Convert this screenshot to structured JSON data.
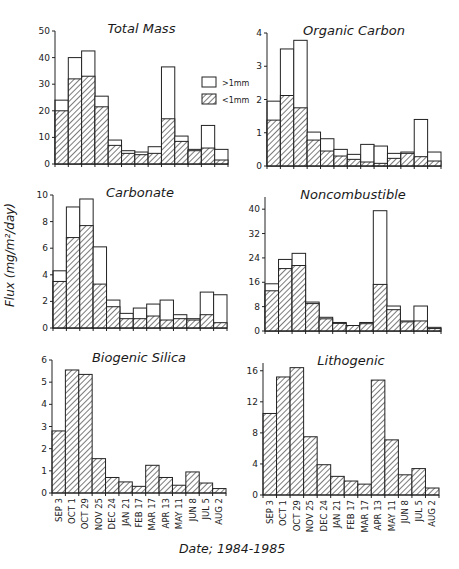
{
  "figure": {
    "ylabel": "Flux (mg/m²/day)",
    "xlabel": "Date; 1984-1985",
    "legend": [
      {
        "key": "coarse",
        "label": ">1mm",
        "style": "open"
      },
      {
        "key": "fine",
        "label": "<1mm",
        "style": "hatched"
      }
    ]
  },
  "chart_data": [
    {
      "type": "bar",
      "stacked": true,
      "title": "Total Mass",
      "xlabel": "Date; 1984-1985",
      "ylabel": "Flux (mg/m²/day)",
      "categories": [
        "SEP 3",
        "OCT 1",
        "OCT 29",
        "NOV 25",
        "DEC 24",
        "JAN 21",
        "FEB 17",
        "MAR 17",
        "APR 13",
        "MAY 11",
        "JUN 8",
        "JUL 5",
        "AUG 2"
      ],
      "ylim": [
        0,
        50
      ],
      "yticks": [
        0,
        10,
        20,
        30,
        40,
        50
      ],
      "legend": {
        "position": "right",
        "entries": [
          ">1mm",
          "<1mm"
        ]
      },
      "series": [
        {
          "name": "<1mm",
          "values": [
            20,
            32,
            33,
            21.5,
            7,
            4,
            3.5,
            4,
            17,
            8.5,
            5,
            6,
            1.5
          ]
        },
        {
          "name": "total (>1mm + <1mm)",
          "values": [
            24,
            40,
            42.5,
            25.5,
            9,
            5,
            4.5,
            6.5,
            36.5,
            10.5,
            5.5,
            14.5,
            5.5
          ]
        }
      ]
    },
    {
      "type": "bar",
      "stacked": true,
      "title": "Organic Carbon",
      "categories": [
        "SEP 3",
        "OCT 1",
        "OCT 29",
        "NOV 25",
        "DEC 24",
        "JAN 21",
        "FEB 17",
        "MAR 17",
        "APR 13",
        "MAY 11",
        "JUN 8",
        "JUL 5",
        "AUG 2"
      ],
      "ylim": [
        0,
        4
      ],
      "yticks": [
        0,
        1,
        2,
        3,
        4
      ],
      "series": [
        {
          "name": "<1mm",
          "values": [
            1.38,
            2.12,
            1.75,
            0.78,
            0.45,
            0.3,
            0.2,
            0.12,
            0.08,
            0.23,
            0.38,
            0.28,
            0.15
          ]
        },
        {
          "name": "total (>1mm + <1mm)",
          "values": [
            1.95,
            3.52,
            3.78,
            1.02,
            0.82,
            0.5,
            0.35,
            0.65,
            0.6,
            0.38,
            0.42,
            1.4,
            0.42
          ]
        }
      ]
    },
    {
      "type": "bar",
      "stacked": true,
      "title": "Carbonate",
      "categories": [
        "SEP 3",
        "OCT 1",
        "OCT 29",
        "NOV 25",
        "DEC 24",
        "JAN 21",
        "FEB 17",
        "MAR 17",
        "APR 13",
        "MAY 11",
        "JUN 8",
        "JUL 5",
        "AUG 2"
      ],
      "ylim": [
        0,
        10
      ],
      "yticks": [
        0,
        2,
        4,
        6,
        8,
        10
      ],
      "series": [
        {
          "name": "<1mm",
          "values": [
            3.5,
            6.8,
            7.7,
            3.3,
            1.6,
            0.7,
            0.7,
            0.9,
            0.6,
            0.7,
            0.6,
            1.0,
            0.4
          ]
        },
        {
          "name": "total (>1mm + <1mm)",
          "values": [
            4.3,
            9.1,
            9.7,
            6.1,
            2.1,
            1.1,
            1.5,
            1.8,
            2.1,
            1.0,
            0.7,
            2.7,
            2.5
          ]
        }
      ]
    },
    {
      "type": "bar",
      "stacked": true,
      "title": "Noncombustible",
      "categories": [
        "SEP 3",
        "OCT 1",
        "OCT 29",
        "NOV 25",
        "DEC 24",
        "JAN 21",
        "FEB 17",
        "MAR 17",
        "APR 13",
        "MAY 11",
        "JUN 8",
        "JUL 5",
        "AUG 2"
      ],
      "ylim": [
        0,
        44
      ],
      "yticks": [
        0,
        8,
        16,
        24,
        32,
        40
      ],
      "series": [
        {
          "name": "<1mm",
          "values": [
            13.2,
            20.5,
            21.5,
            9,
            4,
            2.5,
            1.8,
            2.4,
            15.3,
            7,
            3,
            3.3,
            0.8
          ]
        },
        {
          "name": "total (>1mm + <1mm)",
          "values": [
            15.5,
            23.5,
            25.5,
            9.5,
            4.5,
            2.8,
            1.8,
            2.8,
            39.5,
            8.2,
            3.3,
            8.2,
            1.2
          ]
        }
      ]
    },
    {
      "type": "bar",
      "stacked": false,
      "title": "Biogenic Silica",
      "categories": [
        "SEP 3",
        "OCT 1",
        "OCT 29",
        "NOV 25",
        "DEC 24",
        "JAN 21",
        "FEB 17",
        "MAR 17",
        "APR 13",
        "MAY 11",
        "JUN 8",
        "JUL 5",
        "AUG 2"
      ],
      "ylim": [
        0,
        6
      ],
      "yticks": [
        0,
        1,
        2,
        3,
        4,
        5,
        6
      ],
      "series": [
        {
          "name": "<1mm",
          "values": [
            2.8,
            5.55,
            5.35,
            1.55,
            0.7,
            0.5,
            0.3,
            1.25,
            0.7,
            0.35,
            0.95,
            0.45,
            0.2
          ]
        }
      ]
    },
    {
      "type": "bar",
      "stacked": false,
      "title": "Lithogenic",
      "categories": [
        "SEP 3",
        "OCT 1",
        "OCT 29",
        "NOV 25",
        "DEC 24",
        "JAN 21",
        "FEB 17",
        "MAR 17",
        "APR 13",
        "MAY 11",
        "JUN 8",
        "JUL 5",
        "AUG 2"
      ],
      "ylim": [
        0,
        17
      ],
      "yticks": [
        0,
        4,
        8,
        12,
        16
      ],
      "series": [
        {
          "name": "<1mm",
          "values": [
            10.5,
            15.2,
            16.4,
            7.5,
            3.9,
            2.4,
            1.8,
            1.4,
            14.8,
            7.1,
            2.6,
            3.4,
            0.9
          ]
        }
      ]
    }
  ],
  "layout": {
    "panels": [
      {
        "x0": 55,
        "x1": 228,
        "y0": 164,
        "ytop": 31
      },
      {
        "x0": 267,
        "x1": 441,
        "y0": 166,
        "ytop": 33
      },
      {
        "x0": 53,
        "x1": 227,
        "y0": 328,
        "ytop": 195
      },
      {
        "x0": 265,
        "x1": 441,
        "y0": 331,
        "ytop": 197
      },
      {
        "x0": 52,
        "x1": 226,
        "y0": 493,
        "ytop": 360
      },
      {
        "x0": 263,
        "x1": 439,
        "y0": 495,
        "ytop": 363
      }
    ],
    "show_xtick_labels": [
      false,
      false,
      false,
      false,
      true,
      true
    ]
  }
}
